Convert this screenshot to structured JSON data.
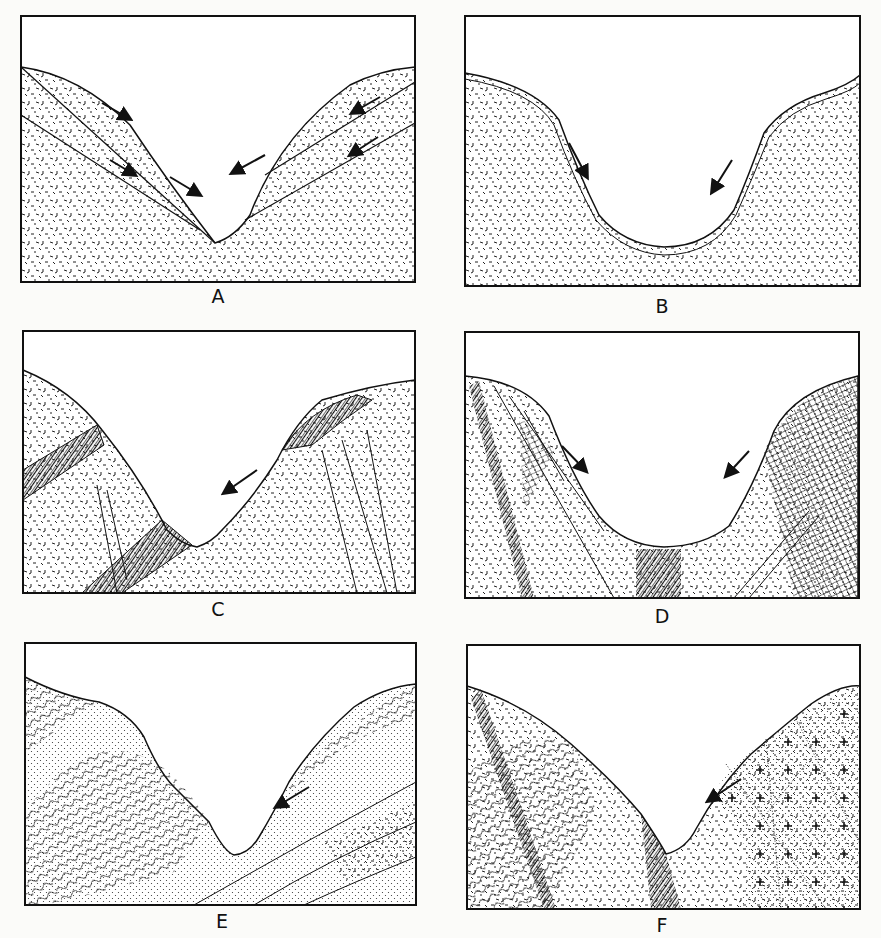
{
  "figure": {
    "panels": [
      {
        "id": "A",
        "label": "A",
        "valley_shape": "V-shaped",
        "arrows": 6
      },
      {
        "id": "B",
        "label": "B",
        "valley_shape": "U-shaped",
        "arrows": 2
      },
      {
        "id": "C",
        "label": "C",
        "valley_shape": "asymmetric V",
        "arrows": 1
      },
      {
        "id": "D",
        "label": "D",
        "valley_shape": "U-shaped",
        "arrows": 2
      },
      {
        "id": "E",
        "label": "E",
        "valley_shape": "asymmetric V",
        "arrows": 1
      },
      {
        "id": "F",
        "label": "F",
        "valley_shape": "V-shaped",
        "arrows": 1
      }
    ]
  },
  "colors": {
    "ink": "#111111",
    "paper": "#fbfbf9"
  }
}
